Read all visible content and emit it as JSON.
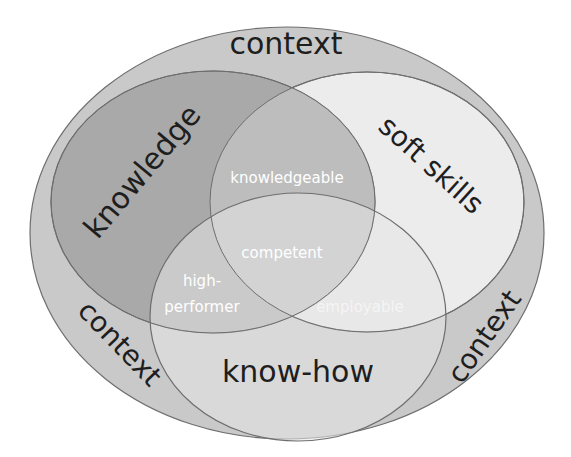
{
  "diagram": {
    "type": "venn",
    "colors": {
      "context": "#c9c9c9",
      "knowledge": "#a9a9a9",
      "soft_skills": "#ececec",
      "know_how": "#e3e3e3",
      "stroke": "#6e6e6e",
      "dark_text": "#1e1e1e",
      "light_text": "#ffffff"
    },
    "sets": {
      "context_top": "context",
      "context_left": "context",
      "context_right": "context",
      "knowledge": "knowledge",
      "soft_skills": "soft skills",
      "know_how": "know-how"
    },
    "intersections": {
      "knowledge_soft_skills": "knowledgeable",
      "all_three": "competent",
      "knowledge_know_how_line1": "high-",
      "knowledge_know_how_line2": "performer",
      "soft_skills_know_how": "employable"
    }
  }
}
